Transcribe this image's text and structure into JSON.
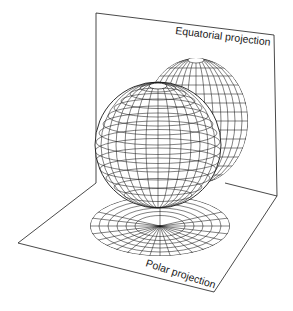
{
  "diagram": {
    "type": "map-projection-illustration",
    "labels": {
      "equatorial": "Equatorial projection",
      "polar": "Polar projection"
    },
    "elements": [
      {
        "name": "globe",
        "description": "wireframe sphere with latitude/longitude graticule"
      },
      {
        "name": "equatorial-projection-plane",
        "description": "vertical plane behind globe"
      },
      {
        "name": "equatorial-projection-image",
        "description": "graticule projected onto vertical plane"
      },
      {
        "name": "polar-projection-plane",
        "description": "horizontal floor plane under globe"
      },
      {
        "name": "polar-projection-image",
        "description": "azimuthal graticule projected onto floor"
      }
    ],
    "colors": {
      "line": "#1a1a1a",
      "background": "#ffffff"
    }
  }
}
